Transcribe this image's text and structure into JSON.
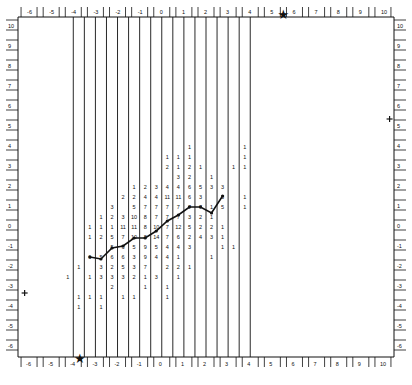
{
  "chart_data": {
    "type": "heatmap",
    "title": "",
    "x_axis": {
      "ticks": [
        -6,
        -5,
        -4,
        -3,
        -2,
        -1,
        0,
        1,
        2,
        3,
        4,
        5,
        6,
        7,
        8,
        9,
        10
      ],
      "range": [
        -6.5,
        10.5
      ]
    },
    "y_axis": {
      "ticks": [
        10,
        9,
        8,
        7,
        6,
        5,
        4,
        3,
        2,
        1,
        0,
        -1,
        -2,
        -3,
        -4,
        -5,
        -6
      ],
      "range": [
        -6.5,
        10.5
      ]
    },
    "axes_on_all_sides": true,
    "grid": "vertical strip lines from x=-4 to x=4 (two lines per unit)",
    "markers": [
      {
        "symbol": "star",
        "x": 5.5,
        "y": 10.6
      },
      {
        "symbol": "star",
        "x": -3.7,
        "y": -6.6
      },
      {
        "symbol": "plus",
        "x": -6.2,
        "y": -3.3
      },
      {
        "symbol": "plus",
        "x": 10.3,
        "y": 5.4
      }
    ],
    "columns": [
      -3.75,
      -3.25,
      -2.75,
      -2.25,
      -1.75,
      -1.25,
      -0.75,
      -0.25,
      0.25,
      0.75,
      1.25,
      1.75,
      2.25,
      2.75,
      3.25,
      3.75
    ],
    "count_rows": [
      {
        "y": 4.0,
        "cells": {
          "1.25": "1",
          "3.75": "1"
        }
      },
      {
        "y": 3.5,
        "cells": {
          "0.25": "1",
          "0.75": "1",
          "1.25": "1",
          "3.75": "1"
        }
      },
      {
        "y": 3.0,
        "cells": {
          "0.25": "2",
          "0.75": "1",
          "1.25": "2",
          "1.75": "1",
          "3.25": "1",
          "3.75": "1"
        }
      },
      {
        "y": 2.5,
        "cells": {
          "0.75": "3",
          "1.25": "2",
          "2.25": "1"
        }
      },
      {
        "y": 2.0,
        "cells": {
          "-1.25": "1",
          "-0.75": "2",
          "-0.25": "3",
          "0.25": "4",
          "0.75": "4",
          "1.25": "6",
          "1.75": "5",
          "2.25": "3",
          "2.75": "3"
        }
      },
      {
        "y": 1.5,
        "cells": {
          "-1.75": "2",
          "-1.25": "2",
          "-0.75": "4",
          "-0.25": "4",
          "0.25": "11",
          "0.75": "11",
          "1.25": "6",
          "1.75": "3",
          "2.75": "3",
          "3.75": "1"
        }
      },
      {
        "y": 1.0,
        "cells": {
          "-2.25": "3",
          "-1.25": "5",
          "-0.75": "7",
          "-0.25": "7",
          "0.25": "7",
          "0.75": "7",
          "1.25": "7",
          "1.75": "7",
          "2.25": "1",
          "2.75": "5",
          "3.75": "1"
        }
      },
      {
        "y": 0.5,
        "cells": {
          "-2.75": "1",
          "-2.25": "2",
          "-1.75": "3",
          "-1.25": "10",
          "-0.75": "8",
          "-0.25": "7",
          "0.25": "7",
          "0.75": "7",
          "1.25": "3",
          "1.75": "2",
          "2.25": "1"
        }
      },
      {
        "y": 0.0,
        "cells": {
          "-3.25": "1",
          "-2.75": "1",
          "-2.25": "1",
          "-1.75": "11",
          "-1.25": "11",
          "-0.75": "8",
          "-0.25": "10",
          "0.25": "7",
          "0.75": "12",
          "1.25": "5",
          "1.75": "2",
          "2.25": "2",
          "2.75": "1"
        }
      },
      {
        "y": -0.5,
        "cells": {
          "-3.25": "1",
          "-2.75": "2",
          "-2.25": "5",
          "-1.75": "7",
          "-1.25": "10",
          "-0.75": "8",
          "-0.25": "14",
          "0.25": "7",
          "0.75": "6",
          "1.25": "2",
          "1.75": "4",
          "2.25": "3",
          "2.75": "1"
        }
      },
      {
        "y": -1.0,
        "cells": {
          "-2.25": "5",
          "-1.75": "6",
          "-1.25": "5",
          "-0.75": "9",
          "-0.25": "5",
          "0.25": "4",
          "0.75": "4",
          "1.25": "3",
          "2.75": "1",
          "3.25": "1"
        }
      },
      {
        "y": -1.5,
        "cells": {
          "-3.25": "6",
          "-2.75": "5",
          "-2.25": "6",
          "-1.75": "6",
          "-1.25": "3",
          "-0.75": "9",
          "-0.25": "4",
          "0.25": "4",
          "0.75": "1",
          "2.25": "1"
        }
      },
      {
        "y": -2.0,
        "cells": {
          "-3.75": "1",
          "-2.75": "3",
          "-2.25": "2",
          "-1.75": "5",
          "-1.25": "3",
          "-0.75": "7",
          "0.25": "2",
          "0.75": "2",
          "1.25": "1"
        }
      },
      {
        "y": -2.5,
        "cells": {
          "-4.25": "1",
          "-3.25": "1",
          "-2.75": "3",
          "-2.25": "3",
          "-1.75": "3",
          "-1.25": "2",
          "-0.75": "1",
          "-0.25": "3",
          "0.75": "1"
        }
      },
      {
        "y": -3.0,
        "cells": {
          "-2.25": "2",
          "-0.75": "1",
          "0.25": "1"
        }
      },
      {
        "y": -3.5,
        "cells": {
          "-3.75": "1",
          "-3.25": "1",
          "-2.75": "1",
          "-1.75": "1",
          "-1.25": "1",
          "0.25": "1"
        }
      },
      {
        "y": -4.0,
        "cells": {
          "-3.75": "1",
          "-2.75": "1"
        }
      }
    ],
    "trend_line": {
      "x": [
        -3.25,
        -2.75,
        -2.25,
        -1.75,
        -1.25,
        -0.75,
        -0.25,
        0.25,
        0.75,
        1.25,
        1.75,
        2.25,
        2.75
      ],
      "y": [
        -1.5,
        -1.6,
        -1.05,
        -0.95,
        -0.55,
        -0.55,
        -0.2,
        0.3,
        0.6,
        1.0,
        1.0,
        0.7,
        1.55
      ]
    }
  }
}
